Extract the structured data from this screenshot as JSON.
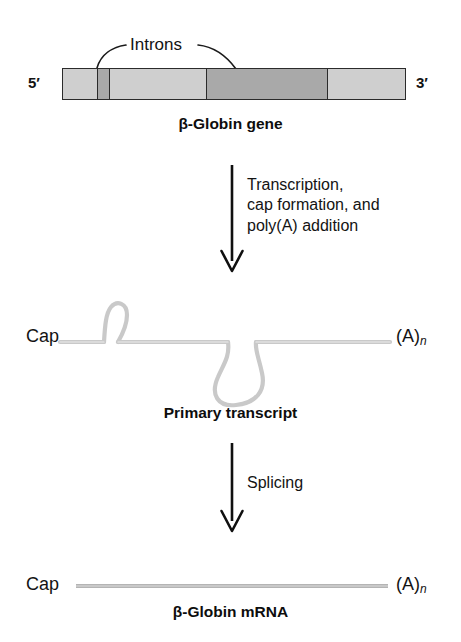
{
  "figure": {
    "background_color": "#ffffff",
    "ink_color": "#131313"
  },
  "gene_stage": {
    "five_prime_label": "5′",
    "three_prime_label": "3′",
    "intron_callout_label": "Introns",
    "caption": "β-Globin gene",
    "segments": [
      {
        "name": "exon-1",
        "kind": "exon",
        "color": "#cfcfcf",
        "width_pct": 9.9
      },
      {
        "name": "intron-1",
        "kind": "intron",
        "color": "#a9a9a9",
        "width_pct": 3.5
      },
      {
        "name": "exon-2",
        "kind": "exon",
        "color": "#cfcfcf",
        "width_pct": 28.5
      },
      {
        "name": "intron-2",
        "kind": "intron",
        "color": "#a9a9a9",
        "width_pct": 35.4
      },
      {
        "name": "exon-3",
        "kind": "exon",
        "color": "#cfcfcf",
        "width_pct": 22.7
      }
    ]
  },
  "transcription_arrow": {
    "label_lines": [
      "Transcription,",
      "cap formation, and",
      "poly(A) addition"
    ]
  },
  "transcript_stage": {
    "cap_label": "Cap",
    "polya_label": "(A)",
    "polya_subscript": "n",
    "caption": "Primary transcript",
    "strand_color": "#c9c9c9",
    "loops": [
      {
        "name": "intron-1-loop",
        "direction": "up",
        "size": "small"
      },
      {
        "name": "intron-2-loop",
        "direction": "down",
        "size": "large"
      }
    ]
  },
  "splicing_arrow": {
    "label": "Splicing"
  },
  "mrna_stage": {
    "cap_label": "Cap",
    "polya_label": "(A)",
    "polya_subscript": "n",
    "caption": "β-Globin mRNA",
    "strand_color": "#c9c9c9"
  }
}
